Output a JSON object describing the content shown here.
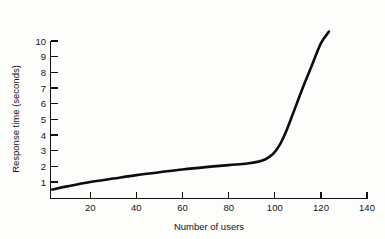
{
  "chart_data": {
    "type": "line",
    "title": "",
    "subtitle": "",
    "xlabel": "Number of users",
    "ylabel": "Response time (seconds)",
    "xlim": [
      0,
      145
    ],
    "ylim": [
      0,
      10.6
    ],
    "xticks": [
      20,
      40,
      60,
      80,
      100,
      120,
      140
    ],
    "yticks": [
      1,
      2,
      3,
      4,
      5,
      6,
      7,
      8,
      9,
      10
    ],
    "xtick_labels": [
      "20",
      "40",
      "60",
      "80",
      "100",
      "120",
      "140"
    ],
    "ytick_labels": [
      "1",
      "2",
      "3",
      "4",
      "5",
      "6",
      "7",
      "8",
      "9",
      "10"
    ],
    "grid": false,
    "legend": null,
    "legend_position": "none",
    "annotations": [],
    "series": [
      {
        "name": "Response time",
        "color": "#0d0d0d",
        "line_width": 2.6,
        "marker": "none",
        "x": [
          3.5,
          10,
          20,
          30,
          40,
          50,
          60,
          70,
          80,
          88,
          93,
          96,
          99,
          101,
          103,
          105,
          108,
          112,
          116,
          120,
          123.5
        ],
        "y": [
          0.52,
          0.72,
          1.0,
          1.22,
          1.44,
          1.62,
          1.8,
          1.95,
          2.08,
          2.18,
          2.3,
          2.45,
          2.75,
          3.1,
          3.6,
          4.25,
          5.4,
          6.95,
          8.4,
          9.85,
          10.6
        ]
      }
    ]
  },
  "axes": {
    "y_axis_name": "response-time-axis",
    "x_axis_name": "number-of-users-axis"
  },
  "colors": {
    "background": "#fdfdfc",
    "ink": "#111111",
    "curve": "#0d0d0d"
  }
}
